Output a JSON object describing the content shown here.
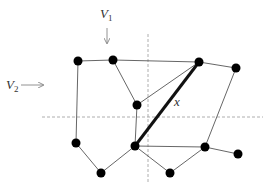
{
  "figure": {
    "width": 268,
    "height": 189,
    "colors": {
      "edge": "#555555",
      "node": "#000000",
      "dashed": "#999999",
      "arrow": "#777777",
      "highlight": "#111111",
      "text": "#333333"
    }
  },
  "labels": {
    "v1_main": "V",
    "v1_sub": "1",
    "v2_main": "V",
    "v2_sub": "2",
    "edge_x": "x"
  },
  "separators": {
    "vertical": {
      "x": 148,
      "y1": 34,
      "y2": 183,
      "name": "V1"
    },
    "horizontal": {
      "y": 117,
      "x1": 42,
      "x2": 263,
      "name": "V2"
    }
  },
  "nodes": [
    {
      "id": "A",
      "x": 78,
      "y": 61
    },
    {
      "id": "B",
      "x": 113,
      "y": 60
    },
    {
      "id": "C",
      "x": 199,
      "y": 62
    },
    {
      "id": "D",
      "x": 236,
      "y": 68
    },
    {
      "id": "E",
      "x": 137,
      "y": 105
    },
    {
      "id": "F",
      "x": 76,
      "y": 143
    },
    {
      "id": "G",
      "x": 101,
      "y": 173
    },
    {
      "id": "H",
      "x": 135,
      "y": 146
    },
    {
      "id": "I",
      "x": 170,
      "y": 173
    },
    {
      "id": "J",
      "x": 205,
      "y": 147
    },
    {
      "id": "K",
      "x": 238,
      "y": 154
    }
  ],
  "edges": [
    {
      "from": "A",
      "to": "B"
    },
    {
      "from": "B",
      "to": "C"
    },
    {
      "from": "C",
      "to": "D"
    },
    {
      "from": "A",
      "to": "F"
    },
    {
      "from": "F",
      "to": "G"
    },
    {
      "from": "G",
      "to": "H"
    },
    {
      "from": "B",
      "to": "E"
    },
    {
      "from": "E",
      "to": "C"
    },
    {
      "from": "E",
      "to": "H"
    },
    {
      "from": "H",
      "to": "C",
      "highlight": true,
      "label": "x"
    },
    {
      "from": "H",
      "to": "J"
    },
    {
      "from": "H",
      "to": "I"
    },
    {
      "from": "I",
      "to": "J"
    },
    {
      "from": "J",
      "to": "D"
    },
    {
      "from": "J",
      "to": "K"
    }
  ]
}
